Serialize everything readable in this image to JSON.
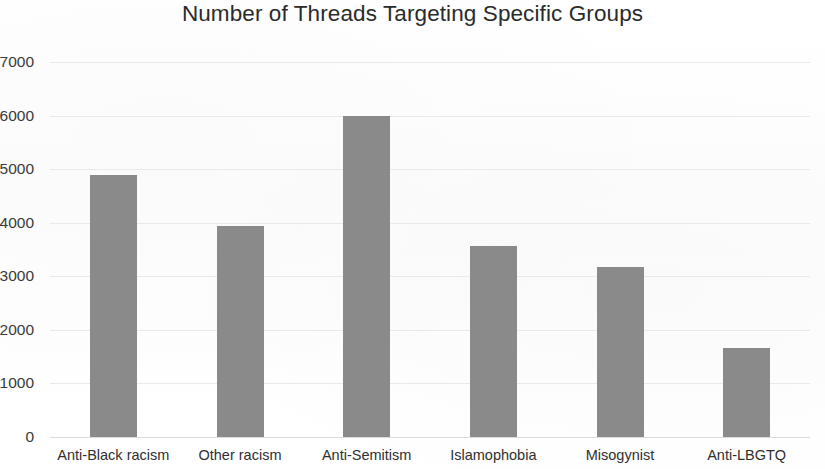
{
  "chart_data": {
    "type": "bar",
    "title": "Number of Threads Targeting Specific Groups",
    "xlabel": "",
    "ylabel": "",
    "categories": [
      "Anti-Black racism",
      "Other racism",
      "Anti-Semitism",
      "Islamophobia",
      "Misogynist",
      "Anti-LBGTQ"
    ],
    "values": [
      4900,
      3930,
      5990,
      3560,
      3180,
      1670
    ],
    "ylim": [
      0,
      7000
    ],
    "y_ticks": [
      0,
      1000,
      2000,
      3000,
      4000,
      5000,
      6000,
      7000
    ],
    "y_tick_labels": [
      "0",
      "1000",
      "2000",
      "3000",
      "4000",
      "5000",
      "6000",
      "7000"
    ],
    "grid": true,
    "grid_axis": "y",
    "legend": false,
    "bar_color": "#8a8a8a",
    "grid_color": "#e9e9ea",
    "background_color": "#ffffff",
    "text_color": "#2f2f2f"
  }
}
